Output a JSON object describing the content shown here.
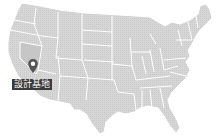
{
  "map": {
    "region": "United States",
    "fill_color": "#d3d3d3",
    "border_color": "#ffffff",
    "highlight_state": "Nevada",
    "highlight_color": "#c4c4c4"
  },
  "marker": {
    "icon": "map-pin-icon",
    "label": "設計基地",
    "label_bg": "#3a3a3a",
    "label_color": "#ffffff",
    "pin_color": "#555555"
  }
}
